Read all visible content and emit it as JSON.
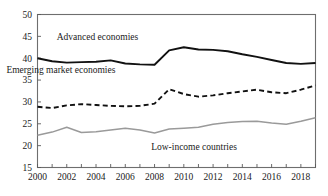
{
  "chart_data": {
    "type": "line",
    "title": "",
    "xlabel": "",
    "ylabel": "",
    "xlim": [
      2000,
      2019
    ],
    "ylim": [
      15,
      50
    ],
    "grid": false,
    "legend": "inline-annotations",
    "x": [
      2000,
      2001,
      2002,
      2003,
      2004,
      2005,
      2006,
      2007,
      2008,
      2009,
      2010,
      2011,
      2012,
      2013,
      2014,
      2015,
      2016,
      2017,
      2018,
      2019
    ],
    "y_ticks": [
      15,
      20,
      25,
      30,
      35,
      40,
      45,
      50
    ],
    "y_tick_labels": [
      "15",
      "20",
      "25",
      "30",
      "35",
      "40",
      "45",
      "50"
    ],
    "x_ticks": [
      2000,
      2001,
      2002,
      2003,
      2004,
      2005,
      2006,
      2007,
      2008,
      2009,
      2010,
      2011,
      2012,
      2013,
      2014,
      2015,
      2016,
      2017,
      2018,
      2019
    ],
    "x_tick_labels": [
      "2000",
      "",
      "2002",
      "",
      "2004",
      "",
      "2006",
      "",
      "2008",
      "",
      "2010",
      "",
      "2012",
      "",
      "2014",
      "",
      "2016",
      "",
      "2018",
      ""
    ],
    "series": [
      {
        "name": "Advanced economies",
        "style": "solid",
        "color": "#111111",
        "width": 1.9,
        "label_x": 2004.1,
        "label_y": 44.2,
        "values": [
          40.0,
          39.3,
          39.0,
          39.1,
          39.2,
          39.5,
          38.8,
          38.6,
          38.5,
          41.8,
          42.5,
          42.0,
          41.9,
          41.6,
          40.9,
          40.3,
          39.6,
          38.9,
          38.7,
          38.9
        ]
      },
      {
        "name": "Emerging market economies",
        "style": "dashed",
        "color": "#111111",
        "width": 1.9,
        "label_x": 2001.6,
        "label_y": 36.6,
        "values": [
          28.9,
          28.6,
          29.2,
          29.5,
          29.3,
          29.1,
          29.0,
          29.1,
          29.6,
          32.9,
          31.8,
          31.2,
          31.5,
          32.0,
          32.4,
          32.8,
          32.2,
          32.0,
          32.8,
          33.8
        ]
      },
      {
        "name": "Low-income countries",
        "style": "solid",
        "color": "#9a9a9a",
        "width": 1.5,
        "label_x": 2010.7,
        "label_y": 18.9,
        "values": [
          22.4,
          23.1,
          24.2,
          23.0,
          23.2,
          23.6,
          24.0,
          23.6,
          22.9,
          23.8,
          24.0,
          24.2,
          24.9,
          25.3,
          25.5,
          25.6,
          25.2,
          24.9,
          25.6,
          26.4
        ]
      }
    ]
  }
}
